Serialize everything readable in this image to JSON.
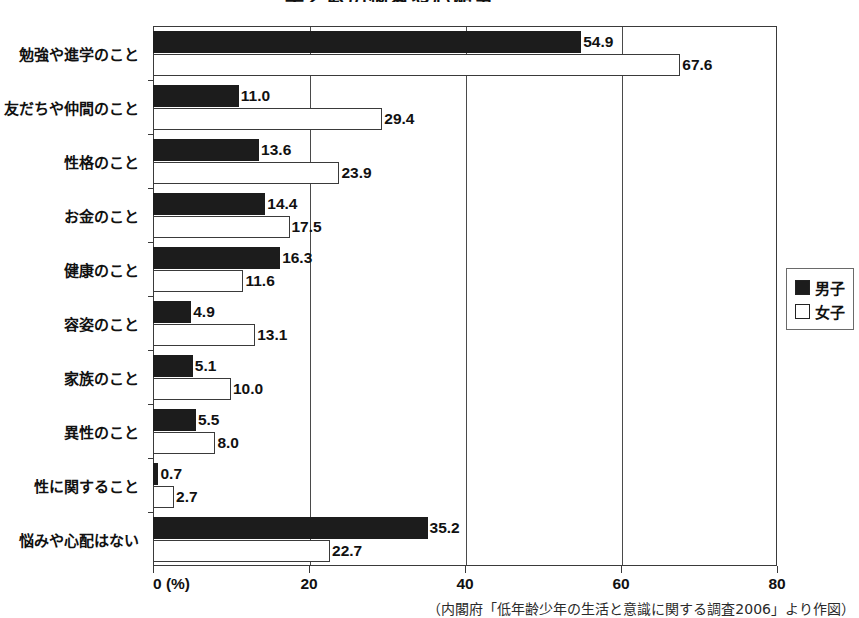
{
  "chart_data": {
    "type": "bar",
    "orientation": "horizontal",
    "title": "子どもの悩みや心配事",
    "xlabel": "(%)",
    "ylabel": "",
    "xlim": [
      0,
      80
    ],
    "xticks": [
      0,
      20,
      40,
      60,
      80
    ],
    "xtick_labels": [
      "0",
      "20",
      "40",
      "60",
      "80"
    ],
    "grid": true,
    "legend_position": "right",
    "categories": [
      "勉強や進学のこと",
      "友だちや仲間のこと",
      "性格のこと",
      "お金のこと",
      "健康のこと",
      "容姿のこと",
      "家族のこと",
      "異性のこと",
      "性に関すること",
      "悩みや心配はない"
    ],
    "series": [
      {
        "name": "男子",
        "color": "#1c1c1c",
        "values": [
          54.9,
          11.0,
          13.6,
          14.4,
          16.3,
          4.9,
          5.1,
          5.5,
          0.7,
          35.2
        ],
        "labels": [
          "54.9",
          "11.0",
          "13.6",
          "14.4",
          "16.3",
          "4.9",
          "5.1",
          "5.5",
          "0.7",
          "35.2"
        ]
      },
      {
        "name": "女子",
        "color": "#ffffff",
        "values": [
          67.6,
          29.4,
          23.9,
          17.5,
          11.6,
          13.1,
          10.0,
          8.0,
          2.7,
          22.7
        ],
        "labels": [
          "67.6",
          "29.4",
          "23.9",
          "17.5",
          "11.6",
          "13.1",
          "10.0",
          "8.0",
          "2.7",
          "22.7"
        ]
      }
    ],
    "unit_label": "(%)",
    "zero_label": "0"
  },
  "legend": {
    "items": [
      {
        "label": "男子",
        "color": "#1c1c1c"
      },
      {
        "label": "女子",
        "color": "#ffffff"
      }
    ]
  },
  "source_note": "（内閣府「低年齢少年の生活と意識に関する調査2006」より作図）"
}
